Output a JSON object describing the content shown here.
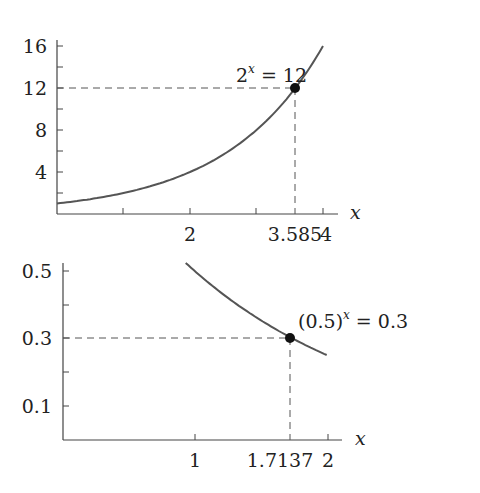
{
  "chart_data": [
    {
      "type": "line",
      "title": "",
      "function": "2^x",
      "xlabel": "x",
      "ylabel": "",
      "xlim": [
        0,
        4.4
      ],
      "ylim": [
        0,
        16.5
      ],
      "x_ticks": [
        1,
        2,
        3,
        4
      ],
      "x_tick_labels": [
        {
          "value": 2,
          "label": "2"
        },
        {
          "value": 3.585,
          "label": "3.585"
        },
        {
          "value": 4,
          "label": "4"
        }
      ],
      "y_ticks": [
        2,
        4,
        6,
        8,
        10,
        12,
        14,
        16
      ],
      "y_tick_labels": [
        {
          "value": 4,
          "label": "4"
        },
        {
          "value": 8,
          "label": "8"
        },
        {
          "value": 12,
          "label": "12"
        },
        {
          "value": 16,
          "label": "16"
        }
      ],
      "series": [
        {
          "name": "2^x",
          "x": [
            0,
            0.5,
            1,
            1.5,
            2,
            2.5,
            3,
            3.5,
            4
          ],
          "values": [
            1,
            1.414,
            2,
            2.828,
            4,
            5.657,
            8,
            11.314,
            16
          ]
        }
      ],
      "highlight_point": {
        "x": 3.585,
        "y": 12,
        "label_base": "2",
        "label_exp": "x",
        "label_rest": " = 12"
      },
      "grid": false
    },
    {
      "type": "line",
      "title": "",
      "function": "(0.5)^x",
      "xlabel": "x",
      "ylabel": "",
      "xlim": [
        0,
        2.2
      ],
      "ylim": [
        0,
        0.52
      ],
      "x_ticks": [
        1,
        2
      ],
      "x_tick_labels": [
        {
          "value": 1,
          "label": "1"
        },
        {
          "value": 1.7137,
          "label": "1.7137"
        },
        {
          "value": 2,
          "label": "2"
        }
      ],
      "y_ticks": [
        0.1,
        0.2,
        0.3,
        0.4,
        0.5
      ],
      "y_tick_labels": [
        {
          "value": 0.1,
          "label": "0.1"
        },
        {
          "value": 0.3,
          "label": "0.3"
        },
        {
          "value": 0.5,
          "label": "0.5"
        }
      ],
      "series": [
        {
          "name": "(0.5)^x",
          "x": [
            0.93,
            1,
            1.25,
            1.5,
            1.75,
            2
          ],
          "values": [
            0.525,
            0.5,
            0.42,
            0.354,
            0.297,
            0.25
          ]
        }
      ],
      "highlight_point": {
        "x": 1.7137,
        "y": 0.3,
        "label_base": "(0.5)",
        "label_exp": "x",
        "label_rest": " = 0.3"
      },
      "grid": false
    }
  ],
  "top": {
    "xlabel": "x",
    "ylabels": [
      "16",
      "12",
      "8",
      "4"
    ],
    "xlabels": [
      "2",
      "3.585",
      "4"
    ],
    "annot_base": "2",
    "annot_exp": "x",
    "annot_rest": "= 12"
  },
  "bottom": {
    "xlabel": "x",
    "ylabels": [
      "0.5",
      "0.3",
      "0.1"
    ],
    "xlabels": [
      "1",
      "1.7137",
      "2"
    ],
    "annot_base": "(0.5)",
    "annot_exp": "x",
    "annot_rest": "= 0.3"
  },
  "colors": {
    "curve": "#555555",
    "axis": "#444444",
    "dash": "#555555",
    "dot": "#111111"
  }
}
